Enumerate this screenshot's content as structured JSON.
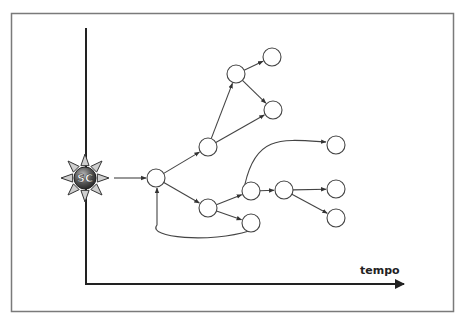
{
  "diagram": {
    "axis_label": "tempo",
    "source": {
      "label": "SC",
      "x": 85,
      "y": 178
    },
    "colors": {
      "frame": "#7a7a7a",
      "axis": "#222222",
      "edge": "#444444",
      "node_stroke": "#444444",
      "node_fill": "#ffffff",
      "source_fill": "#555555",
      "ray_fill": "#cfcfcf"
    },
    "node_radius": 9,
    "nodes": [
      {
        "id": "n1",
        "x": 156,
        "y": 178
      },
      {
        "id": "n2",
        "x": 208,
        "y": 147
      },
      {
        "id": "n3",
        "x": 236,
        "y": 74
      },
      {
        "id": "n4",
        "x": 272,
        "y": 57
      },
      {
        "id": "n5",
        "x": 273,
        "y": 110
      },
      {
        "id": "n6",
        "x": 208,
        "y": 208
      },
      {
        "id": "n7",
        "x": 251,
        "y": 191
      },
      {
        "id": "n8",
        "x": 251,
        "y": 223
      },
      {
        "id": "n9",
        "x": 284,
        "y": 190
      },
      {
        "id": "n10",
        "x": 336,
        "y": 145
      },
      {
        "id": "n11",
        "x": 336,
        "y": 189
      },
      {
        "id": "n12",
        "x": 336,
        "y": 218
      }
    ],
    "edges": [
      {
        "from": "src",
        "to": "n1",
        "type": "straight"
      },
      {
        "from": "n1",
        "to": "n2",
        "type": "straight"
      },
      {
        "from": "n2",
        "to": "n3",
        "type": "straight"
      },
      {
        "from": "n3",
        "to": "n4",
        "type": "straight"
      },
      {
        "from": "n3",
        "to": "n5",
        "type": "straight"
      },
      {
        "from": "n2",
        "to": "n5",
        "type": "straight"
      },
      {
        "from": "n1",
        "to": "n6",
        "type": "straight"
      },
      {
        "from": "n6",
        "to": "n7",
        "type": "straight"
      },
      {
        "from": "n6",
        "to": "n8",
        "type": "straight"
      },
      {
        "from": "n7",
        "to": "n9",
        "type": "straight"
      },
      {
        "from": "n7",
        "to": "n10",
        "type": "curve"
      },
      {
        "from": "n9",
        "to": "n11",
        "type": "straight"
      },
      {
        "from": "n9",
        "to": "n12",
        "type": "straight"
      },
      {
        "from": "n8",
        "to": "n1",
        "type": "feedback"
      }
    ]
  }
}
